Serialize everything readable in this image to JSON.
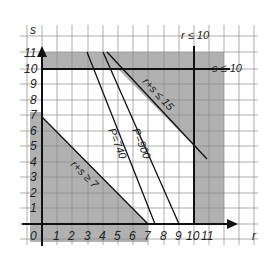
{
  "diagram": {
    "type": "linear-programming-feasible-region",
    "axes": {
      "x_label": "r",
      "y_label": "s",
      "origin_label": "0",
      "x_ticks": [
        "1",
        "2",
        "3",
        "4",
        "5",
        "6",
        "7",
        "8",
        "9",
        "10",
        "11"
      ],
      "y_ticks": [
        "1",
        "2",
        "3",
        "4",
        "5",
        "6",
        "7",
        "8",
        "9",
        "10",
        "11"
      ]
    },
    "constraints": [
      {
        "id": "r_le_10",
        "label": "r ≤ 10"
      },
      {
        "id": "s_le_10",
        "label": "s ≤ 10"
      },
      {
        "id": "r_plus_s_le_15",
        "label": "r+s ≤ 15"
      },
      {
        "id": "r_plus_s_ge_7",
        "label": "r+s ≥ 7"
      }
    ],
    "objective_lines": [
      {
        "id": "p740",
        "label": "P=740"
      },
      {
        "id": "p900",
        "label": "P=900"
      }
    ],
    "colors": {
      "shade": "#a9a9a9",
      "grid": "#8a8a8a",
      "line": "#111111",
      "background": "#ffffff"
    }
  }
}
